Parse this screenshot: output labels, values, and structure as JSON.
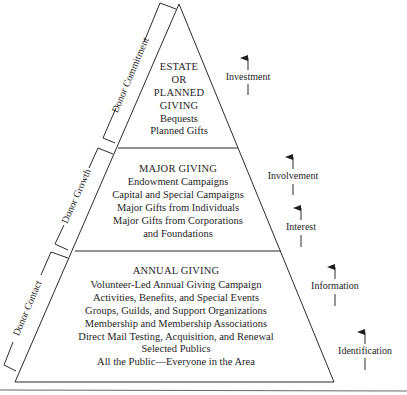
{
  "diagram": {
    "type": "donor pyramid",
    "tiers": [
      {
        "title_lines": [
          "ESTATE",
          "OR",
          "PLANNED",
          "GIVING"
        ],
        "items": [
          "Bequests",
          "Planned Gifts"
        ]
      },
      {
        "title_lines": [
          "MAJOR GIVING"
        ],
        "items": [
          "Endowment Campaigns",
          "Capital and Special Campaigns",
          "Major Gifts from Individuals",
          "Major Gifts from Corporations",
          "and Foundations"
        ]
      },
      {
        "title_lines": [
          "ANNUAL GIVING"
        ],
        "items": [
          "Volunteer-Led Annual Giving Campaign",
          "Activities, Benefits, and Special Events",
          "Groups, Guilds, and Support Organizations",
          "Membership and Membership Associations",
          "Direct Mail Testing, Acquisition, and Renewal",
          "Selected Publics",
          "All the Public—Everyone in the Area"
        ]
      }
    ],
    "brackets": [
      {
        "label": "Donor Commitment"
      },
      {
        "label": "Donor Growth"
      },
      {
        "label": "Donor Contact"
      }
    ],
    "stages": [
      {
        "label": "Investment"
      },
      {
        "label": "Involvement"
      },
      {
        "label": "Interest"
      },
      {
        "label": "Information"
      },
      {
        "label": "Identification"
      }
    ]
  }
}
